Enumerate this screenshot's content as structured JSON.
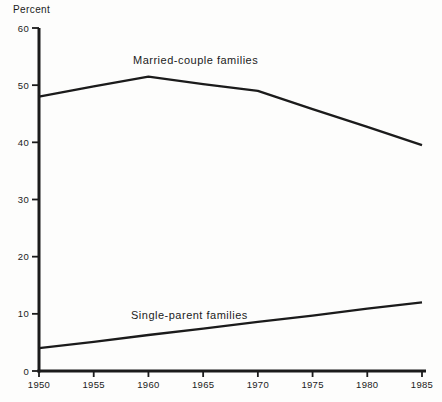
{
  "chart_data": {
    "type": "line",
    "title": "",
    "ylabel": "Percent",
    "xlabel": "",
    "ylim": [
      0,
      60
    ],
    "y_ticks": [
      0,
      10,
      20,
      30,
      40,
      50,
      60
    ],
    "categories": [
      1950,
      1955,
      1960,
      1965,
      1970,
      1975,
      1980,
      1985
    ],
    "x_ticks": [
      1950,
      1955,
      1960,
      1965,
      1970,
      1975,
      1980,
      1985
    ],
    "series": [
      {
        "name": "Married-couple families",
        "values": [
          48,
          49.8,
          51.5,
          50.2,
          49,
          45.8,
          42.7,
          39.5
        ]
      },
      {
        "name": "Single-parent families",
        "values": [
          4,
          5.1,
          6.3,
          7.4,
          8.6,
          9.7,
          10.9,
          12
        ]
      }
    ],
    "grid": false,
    "legend_position": "inline-labels",
    "line_color": "#1b1b1b",
    "axis_color": "#1b1b1b",
    "background_color": "#fdfdfc"
  }
}
